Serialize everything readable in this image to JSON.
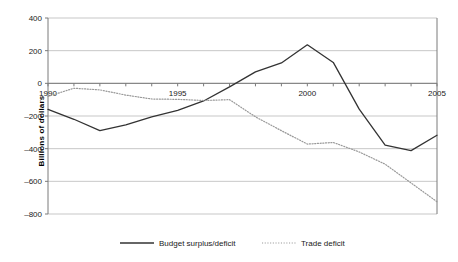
{
  "chart_data": {
    "type": "line",
    "title": "",
    "xlabel": "",
    "ylabel": "Billions of dollars",
    "xlim": [
      1990,
      2005
    ],
    "ylim": [
      -800,
      400
    ],
    "ytick_values": [
      400,
      200,
      0,
      -200,
      -400,
      -600,
      -800
    ],
    "ytick_labels": [
      "400",
      "200",
      "0",
      "–200",
      "–400",
      "–600",
      "–800"
    ],
    "xtick_values": [
      1990,
      1991,
      1992,
      1993,
      1994,
      1995,
      1996,
      1997,
      1998,
      1999,
      2000,
      2001,
      2002,
      2003,
      2004,
      2005
    ],
    "xtick_labels": [
      "1990",
      "",
      "",
      "",
      "",
      "1995",
      "",
      "",
      "",
      "",
      "2000",
      "",
      "",
      "",
      "",
      "2005"
    ],
    "grid": "horizontal",
    "legend_position": "bottom",
    "x": [
      1990,
      1991,
      1992,
      1993,
      1994,
      1995,
      1996,
      1997,
      1998,
      1999,
      2000,
      2001,
      2002,
      2003,
      2004,
      2005
    ],
    "series": [
      {
        "name": "Budget surplus/deficit",
        "style": "solid",
        "color": "#333333",
        "values": [
          -160,
          -220,
          -290,
          -255,
          -205,
          -165,
          -108,
          -22,
          70,
          125,
          236,
          128,
          -158,
          -378,
          -412,
          -318
        ]
      },
      {
        "name": "Trade deficit",
        "style": "dotted",
        "color": "#999999",
        "values": [
          -80,
          -30,
          -40,
          -72,
          -96,
          -98,
          -105,
          -100,
          -205,
          -290,
          -372,
          -362,
          -420,
          -495,
          -610,
          -725
        ]
      }
    ]
  },
  "legend": {
    "items": [
      {
        "label": "Budget surplus/deficit",
        "style": "solid"
      },
      {
        "label": "Trade deficit",
        "style": "dotted"
      }
    ]
  }
}
